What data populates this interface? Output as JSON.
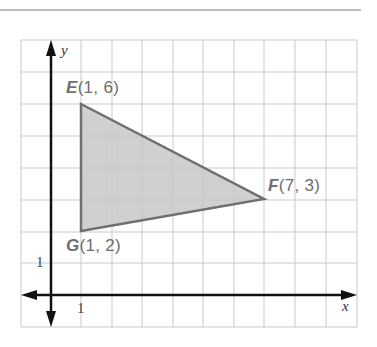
{
  "diagram": {
    "type": "coordinate-plane-triangle",
    "axes": {
      "x_label": "x",
      "y_label": "y",
      "x_tick": "1",
      "y_tick": "1"
    },
    "grid": {
      "x_range": [
        -1,
        10
      ],
      "y_range": [
        -1,
        8
      ]
    },
    "points": [
      {
        "name": "E",
        "coords": "(1, 6)",
        "x": 1,
        "y": 6
      },
      {
        "name": "F",
        "coords": "(7, 3)",
        "x": 7,
        "y": 3
      },
      {
        "name": "G",
        "coords": "(1, 2)",
        "x": 1,
        "y": 2
      }
    ],
    "fill_color": "#c8c8c8",
    "edge_color": "#6f6f6f"
  }
}
